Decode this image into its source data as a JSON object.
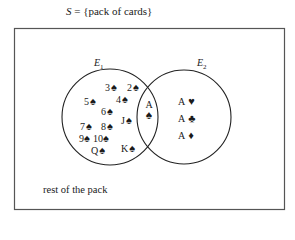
{
  "title": {
    "var": "S",
    "rest": " = {pack of cards}"
  },
  "diagram": {
    "rectangle": {
      "x": 14,
      "y": 28,
      "width": 270,
      "height": 181,
      "stroke": "#555555"
    },
    "sets": [
      {
        "name": "E",
        "sub": "1",
        "label_x": 94,
        "label_y": 59,
        "cx": 110,
        "cy": 117,
        "r": 48
      },
      {
        "name": "E",
        "sub": "2",
        "label_x": 197,
        "label_y": 59,
        "cx": 184,
        "cy": 117,
        "r": 47
      }
    ],
    "outside_label": "rest of the pack",
    "e1_only_cards": [
      {
        "rank": "3",
        "suit": "♠",
        "x": 105,
        "y": 81
      },
      {
        "rank": "2",
        "suit": "♠",
        "x": 127,
        "y": 81
      },
      {
        "rank": "5",
        "suit": "♠",
        "x": 84,
        "y": 96
      },
      {
        "rank": "4",
        "suit": "♠",
        "x": 116,
        "y": 94
      },
      {
        "rank": "6",
        "suit": "♠",
        "x": 101,
        "y": 106
      },
      {
        "rank": "J",
        "suit": "♠",
        "x": 120,
        "y": 115
      },
      {
        "rank": "7",
        "suit": "♠",
        "x": 80,
        "y": 121
      },
      {
        "rank": "8",
        "suit": "♠",
        "x": 101,
        "y": 121
      },
      {
        "rank": "9",
        "suit": "♠",
        "x": 79,
        "y": 133
      },
      {
        "rank": "10",
        "suit": "♠",
        "x": 93,
        "y": 133
      },
      {
        "rank": "Q",
        "suit": "♠",
        "x": 91,
        "y": 145
      },
      {
        "rank": "K",
        "suit": "♠",
        "x": 121,
        "y": 143
      }
    ],
    "intersection_card": {
      "rank": "A",
      "suit": "♠"
    },
    "e2_only_cards": [
      {
        "rank": "A",
        "suit": "♥",
        "x": 178,
        "y": 95
      },
      {
        "rank": "A",
        "suit": "♣",
        "x": 178,
        "y": 113
      },
      {
        "rank": "A",
        "suit": "♦",
        "x": 178,
        "y": 130
      }
    ]
  }
}
